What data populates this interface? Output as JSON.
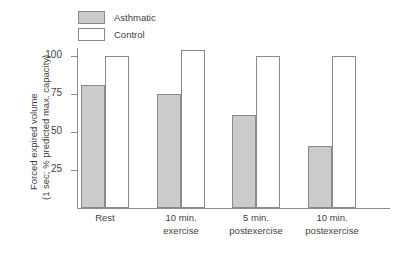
{
  "chart_data": {
    "type": "bar",
    "title": "",
    "xlabel": "",
    "ylabel_line1": "Forced expired volume",
    "ylabel_line2": "(1 sec; % predicted max. capacity)",
    "categories": [
      {
        "line1": "Rest",
        "line2": ""
      },
      {
        "line1": "10 min.",
        "line2": "exercise"
      },
      {
        "line1": "5 min.",
        "line2": "postexercise"
      },
      {
        "line1": "10 min.",
        "line2": "postexercise"
      }
    ],
    "series": [
      {
        "name": "Asthmatic",
        "color": "#cbcbcb",
        "values": [
          81,
          75,
          61,
          41
        ]
      },
      {
        "name": "Control",
        "color": "#ffffff",
        "values": [
          100,
          104,
          100,
          100
        ]
      }
    ],
    "ylim": [
      0,
      110
    ],
    "yticks": [
      25,
      50,
      75,
      100
    ],
    "ytick_labels": [
      "25",
      "50",
      "75",
      "100"
    ],
    "grid": false,
    "legend_position": "top-left-inside"
  },
  "legend": {
    "items": [
      {
        "label": "Asthmatic",
        "swatch": "filled"
      },
      {
        "label": "Control",
        "swatch": "hollow"
      }
    ]
  }
}
